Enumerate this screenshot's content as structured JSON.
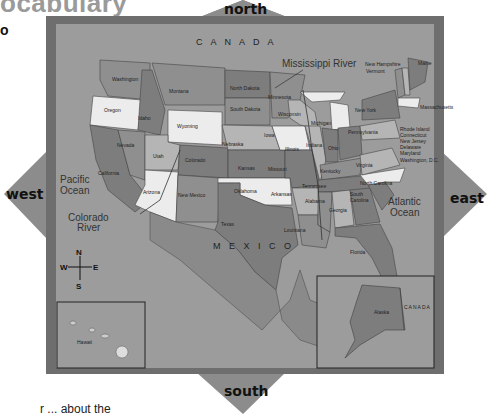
{
  "page": {
    "heading_fragment": "ocabulary",
    "side_bullet": "o",
    "footer_fragment": "r ... about the"
  },
  "compass_arrows": {
    "north": "north",
    "south": "south",
    "east": "east",
    "west": "west"
  },
  "compass_rose": {
    "n": "N",
    "s": "S",
    "e": "E",
    "w": "W"
  },
  "regions": {
    "canada": "C A N A D A",
    "mexico": "M E X I C O",
    "alaska_canada": "CANADA"
  },
  "water": {
    "pacific": [
      "Pacific",
      "Ocean"
    ],
    "atlantic": [
      "Atlantic",
      "Ocean"
    ],
    "mississippi": "Mississippi River",
    "colorado": [
      "Colorado",
      "River"
    ]
  },
  "insets": {
    "hawaii": "Hawaii",
    "alaska": "Alaska"
  },
  "states": {
    "washington": "Washington",
    "oregon": "Oregon",
    "california": "California",
    "idaho": "Idaho",
    "nevada": "Nevada",
    "montana": "Montana",
    "wyoming": "Wyoming",
    "utah": "Utah",
    "arizona": "Arizona",
    "colorado": "Colorado",
    "new_mexico": "New Mexico",
    "north_dakota": "North Dakota",
    "south_dakota": "South Dakota",
    "nebraska": "Nebraska",
    "kansas": "Kansas",
    "oklahoma": "Oklahoma",
    "texas": "Texas",
    "minnesota": "Minnesota",
    "iowa": "Iowa",
    "missouri": "Missouri",
    "arkansas": "Arkansas",
    "louisiana": "Louisiana",
    "wisconsin": "Wisconsin",
    "illinois": "Illinois",
    "michigan": "Michigan",
    "indiana": "Indiana",
    "ohio": "Ohio",
    "kentucky": "Kentucky",
    "tennessee": "Tennessee",
    "mississippi": "Mississippi",
    "alabama": "Alabama",
    "georgia": "Georgia",
    "florida": "Florida",
    "south_carolina": [
      "South",
      "Carolina"
    ],
    "north_carolina": "North Carolina",
    "virginia": "Virginia",
    "west_virginia": "W. Va.",
    "pennsylvania": "Pennsylvania",
    "new_york": "New York",
    "vermont": "Vermont",
    "new_hampshire": "New Hampshire",
    "maine": "Maine",
    "massachusetts": "Massachusetts",
    "rhode_island": "Rhode Island",
    "connecticut": "Connecticut",
    "new_jersey": "New Jersey",
    "delaware": "Delaware",
    "maryland": "Maryland",
    "dc": "Washington, D.C."
  },
  "colors": {
    "background": "#ffffff",
    "frame": "#6e6e6e",
    "map_bg": "#9c9c9c",
    "arrow": "#8c8c8c",
    "state_dark": "#7d7d7d",
    "state_mid": "#8f8f8f",
    "state_light": "#b5b5b5",
    "state_white": "#ececec"
  }
}
